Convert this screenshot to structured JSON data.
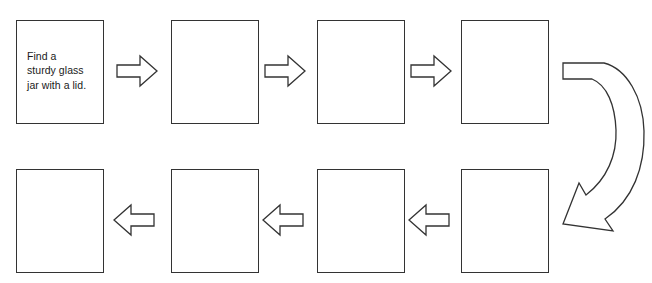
{
  "diagram": {
    "type": "sequencing-flowchart",
    "title": "",
    "line_color": "#333333",
    "fill_color": "#ffffff",
    "text_color": "#1a1a1a",
    "rows": 2,
    "boxes_per_row": 4,
    "boxes": [
      {
        "id": "box-1",
        "row": 1,
        "position": 1,
        "text": "Find a\nsturdy glass\njar with a lid.",
        "filled": true
      },
      {
        "id": "box-2",
        "row": 1,
        "position": 2,
        "text": "",
        "filled": false
      },
      {
        "id": "box-3",
        "row": 1,
        "position": 3,
        "text": "",
        "filled": false
      },
      {
        "id": "box-4",
        "row": 1,
        "position": 4,
        "text": "",
        "filled": false
      },
      {
        "id": "box-5",
        "row": 2,
        "position": 1,
        "text": "",
        "filled": false
      },
      {
        "id": "box-6",
        "row": 2,
        "position": 2,
        "text": "",
        "filled": false
      },
      {
        "id": "box-7",
        "row": 2,
        "position": 3,
        "text": "",
        "filled": false
      },
      {
        "id": "box-8",
        "row": 2,
        "position": 4,
        "text": "",
        "filled": false
      }
    ],
    "connectors": [
      {
        "id": "arrow-1",
        "from": "box-1",
        "to": "box-2",
        "direction": "right",
        "shape": "block-arrow"
      },
      {
        "id": "arrow-2",
        "from": "box-2",
        "to": "box-3",
        "direction": "right",
        "shape": "block-arrow"
      },
      {
        "id": "arrow-3",
        "from": "box-3",
        "to": "box-4",
        "direction": "right",
        "shape": "block-arrow"
      },
      {
        "id": "arrow-wrap",
        "from": "box-4",
        "to": "box-8",
        "direction": "curved-down-left",
        "shape": "curved-block-arrow"
      },
      {
        "id": "arrow-4",
        "from": "box-8",
        "to": "box-7",
        "direction": "left",
        "shape": "block-arrow"
      },
      {
        "id": "arrow-5",
        "from": "box-7",
        "to": "box-6",
        "direction": "left",
        "shape": "block-arrow"
      },
      {
        "id": "arrow-6",
        "from": "box-6",
        "to": "box-5",
        "direction": "left",
        "shape": "block-arrow"
      }
    ]
  }
}
